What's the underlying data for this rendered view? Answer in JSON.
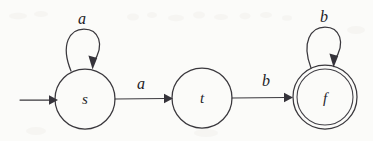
{
  "diagram": {
    "kind": "state-transition-diagram",
    "background_color": "#fbfbf9",
    "ink_color": "#3a383d",
    "states": [
      {
        "id": "s",
        "label": "s",
        "type": "initial",
        "accepting": false,
        "cx": 85,
        "cy": 99,
        "r": 30
      },
      {
        "id": "t",
        "label": "t",
        "type": "normal",
        "accepting": false,
        "cx": 202,
        "cy": 98,
        "r": 30
      },
      {
        "id": "f",
        "label": "f",
        "type": "final",
        "accepting": true,
        "cx": 325,
        "cy": 97,
        "r": 32
      }
    ],
    "transitions": [
      {
        "from": "s",
        "to": "s",
        "label": "a",
        "kind": "self-loop",
        "label_x": 82,
        "label_y": 24
      },
      {
        "from": "s",
        "to": "t",
        "label": "a",
        "kind": "edge",
        "label_x": 141,
        "label_y": 89
      },
      {
        "from": "t",
        "to": "f",
        "label": "b",
        "kind": "edge",
        "label_x": 266,
        "label_y": 86
      },
      {
        "from": "f",
        "to": "f",
        "label": "b",
        "kind": "self-loop",
        "label_x": 324,
        "label_y": 22
      }
    ],
    "start_marker": {
      "label": "start-arrow",
      "x_from": 20,
      "x_to": 55,
      "y": 100
    }
  }
}
